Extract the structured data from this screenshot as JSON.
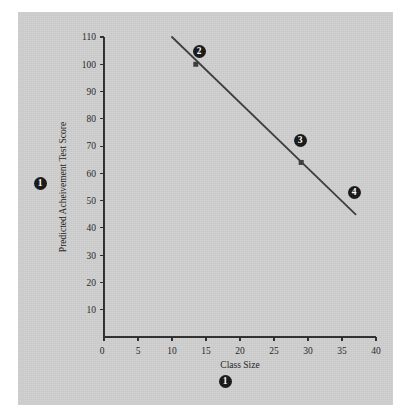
{
  "figure": {
    "background_color": "#cfcfcf",
    "page_color": "#ffffff",
    "line_color": "#3a3a3a",
    "axis_color": "#2b2b2b",
    "callout_color": "#141414"
  },
  "chart_data": {
    "type": "line",
    "title": "",
    "xlabel": "Class Size",
    "ylabel": "Predicted Acheivement Test Score",
    "xlim": [
      0,
      40
    ],
    "ylim": [
      0,
      110
    ],
    "xticks": [
      0,
      5,
      10,
      15,
      20,
      25,
      30,
      35,
      40
    ],
    "xtick_labels": [
      "0",
      "5",
      "10",
      "15",
      "20",
      "25",
      "30",
      "35",
      "40"
    ],
    "yticks": [
      0,
      10,
      20,
      30,
      40,
      50,
      60,
      70,
      80,
      90,
      100,
      110
    ],
    "ytick_labels": [
      "0",
      "10",
      "20",
      "30",
      "40",
      "50",
      "60",
      "70",
      "80",
      "90",
      "100",
      "110"
    ],
    "grid": false,
    "legend": null,
    "series": [
      {
        "name": "Predicted achievement test score",
        "type": "line",
        "x": [
          10,
          37
        ],
        "y": [
          110,
          45
        ],
        "line_endpoints": [
          {
            "x": 10,
            "y": 110
          },
          {
            "x": 37,
            "y": 45
          }
        ]
      }
    ],
    "markers": [
      {
        "x": 13.5,
        "y": 100,
        "shape": "square"
      },
      {
        "x": 29,
        "y": 64,
        "shape": "square"
      }
    ],
    "annotations": [
      {
        "label": "1",
        "placement": "left-of-y-axis-title",
        "px": {
          "x": 40,
          "y": 183
        }
      },
      {
        "label": "2",
        "placement": "above-right-of-first-point",
        "px": {
          "x": 199,
          "y": 51
        }
      },
      {
        "label": "3",
        "placement": "above-right-of-second-point",
        "px": {
          "x": 300,
          "y": 140
        }
      },
      {
        "label": "4",
        "placement": "on-line-lower-right",
        "px": {
          "x": 354,
          "y": 192
        }
      },
      {
        "label": "1",
        "placement": "below-x-axis-title",
        "px": {
          "x": 225,
          "y": 381
        }
      }
    ]
  }
}
